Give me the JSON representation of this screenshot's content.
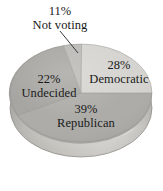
{
  "chart_data": {
    "type": "pie",
    "title": "",
    "subtitle": "",
    "xlabel": "",
    "ylabel": "",
    "grid": false,
    "legend_position": "none",
    "style": "3d-pie-shaded",
    "units": "percent",
    "total": 100,
    "categories": [
      "Democratic",
      "Republican",
      "Undecided",
      "Not voting"
    ],
    "values": [
      28,
      39,
      22,
      11
    ],
    "slices": [
      {
        "label": "Democratic",
        "value": 28,
        "value_text": "28%",
        "color": "#d3d2ce",
        "label_placement": "inside",
        "start_angle_deg": 0,
        "end_angle_deg": 100.8
      },
      {
        "label": "Republican",
        "value": 39,
        "value_text": "39%",
        "color": "#a9a8a4",
        "label_placement": "inside",
        "start_angle_deg": 100.8,
        "end_angle_deg": 241.2
      },
      {
        "label": "Undecided",
        "value": 22,
        "value_text": "22%",
        "color": "#a2a19d",
        "label_placement": "inside",
        "start_angle_deg": 241.2,
        "end_angle_deg": 320.4
      },
      {
        "label": "Not voting",
        "value": 11,
        "value_text": "11%",
        "color": "#b6b5b1",
        "label_placement": "callout",
        "start_angle_deg": 320.4,
        "end_angle_deg": 360
      }
    ],
    "annotations": [
      {
        "name": "not-voting-leader-line",
        "text": "",
        "from": [
          60,
          31
        ],
        "to": [
          78,
          53
        ]
      }
    ]
  },
  "colors": {
    "background": "#ffffff",
    "text": "#1a1a1a",
    "leader_line": "#3a3a3a",
    "pie_democratic": "#d3d2ce",
    "pie_republican": "#a9a8a4",
    "pie_undecided": "#a2a19d",
    "pie_notvoting": "#b6b5b1",
    "pie_rim": "#c9c8c3",
    "pie_rim_shadow": "#9a9995",
    "pie_highlight": "#efeeea",
    "pie_outline": "#8b8a86"
  },
  "labels": {
    "not_voting": {
      "pct": "11%",
      "name": "Not voting"
    },
    "democratic": {
      "pct": "28%",
      "name": "Democratic"
    },
    "republican": {
      "pct": "39%",
      "name": "Republican"
    },
    "undecided": {
      "pct": "22%",
      "name": "Undecided"
    }
  }
}
